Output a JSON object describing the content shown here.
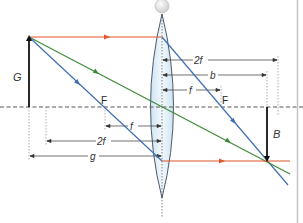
{
  "diagram": {
    "type": "converging-lens-ray-diagram",
    "colors": {
      "parallel_ray": "#e0562a",
      "central_ray": "#3f8a3a",
      "focal_ray": "#3f6fb0",
      "object_arrow": "#111111",
      "axis": "#555555",
      "dimension": "#333333",
      "lens_fill": "#dcecf7",
      "lens_stroke": "#3a4a5a",
      "frame": "#bdbdbd"
    },
    "labels": {
      "object": "G",
      "image": "B",
      "focal_left": "F",
      "focal_right": "F",
      "dim_right_2f": "2f",
      "dim_right_b": "b",
      "dim_right_f": "f",
      "dim_left_f": "f",
      "dim_left_2f": "2f",
      "dim_left_g": "g"
    },
    "rays": [
      {
        "name": "parallel-ray",
        "color": "parallel_ray",
        "description": "parallel to axis, refracted through right focal point"
      },
      {
        "name": "central-ray",
        "color": "central_ray",
        "description": "straight through lens center"
      },
      {
        "name": "focal-ray",
        "color": "focal_ray",
        "description": "through left focal point, exits parallel"
      }
    ]
  }
}
